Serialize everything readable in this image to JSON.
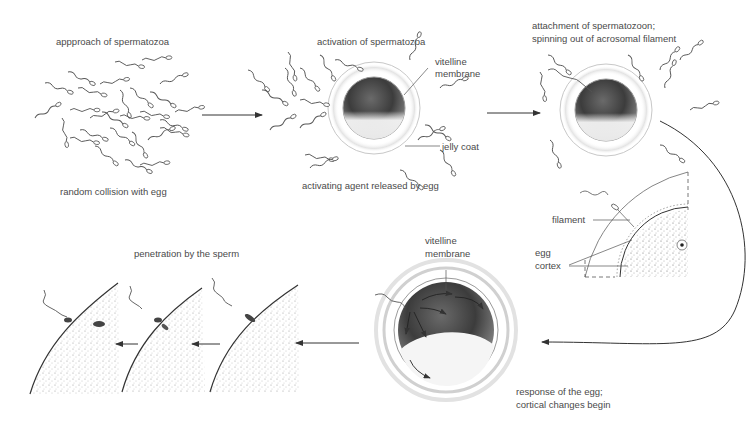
{
  "diagram": {
    "stages": [
      {
        "id": "approach",
        "top_label": "appproach of spermatozoa",
        "bottom_label": "random collision with egg"
      },
      {
        "id": "activation",
        "top_label": "activation of spermatozoa",
        "bottom_label": "activating agent released by egg",
        "callouts": [
          "vitelline membrane",
          "jelly coat"
        ]
      },
      {
        "id": "attachment",
        "top_label_line1": "attachment of spermatozoon;",
        "top_label_line2": "spinning out of acrosomal filament"
      },
      {
        "id": "detail",
        "callouts": [
          "filament",
          "egg cortex"
        ]
      },
      {
        "id": "response",
        "callout_line1": "vitelline",
        "callout_line2": "membrane",
        "bottom_label_line1": "response of the egg;",
        "bottom_label_line2": "cortical changes begin"
      },
      {
        "id": "penetration",
        "top_label": "penetration by the sperm"
      }
    ],
    "labels": {
      "approach_top": "appproach of spermatozoa",
      "approach_bottom": "random collision with egg",
      "activation_top": "activation of spermatozoa",
      "activation_bottom": "activating agent released by egg",
      "vitelline_1": "vitelline",
      "membrane_1": "membrane",
      "jelly_coat": "jelly coat",
      "attach_1": "attachment of spermatozoon;",
      "attach_2": "spinning out of acrosomal filament",
      "filament": "filament",
      "egg": "egg",
      "cortex": "cortex",
      "vitelline_2": "vitelline",
      "membrane_2": "membrane",
      "response_1": "response of the egg;",
      "response_2": "cortical changes begin",
      "penetration": "penetration by the sperm"
    },
    "colors": {
      "ink": "#333333",
      "text": "#4a4a4a",
      "egg_dark": "#3a3a3a",
      "egg_light": "#f2f2f2",
      "coat": "#bdbdbd"
    }
  }
}
